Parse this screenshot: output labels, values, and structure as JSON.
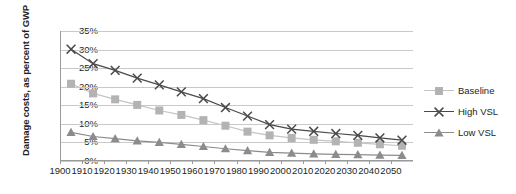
{
  "chart_data": {
    "type": "line",
    "title": "",
    "xlabel": "",
    "ylabel": "Damage costs, as percent of GWP",
    "xlim": [
      1900,
      2060
    ],
    "ylim": [
      0,
      35
    ],
    "ytick_labels": [
      "35%",
      "30%",
      "25%",
      "20%",
      "15%",
      "10%",
      "5%",
      "0%"
    ],
    "ytick_values": [
      35,
      30,
      25,
      20,
      15,
      10,
      5,
      0
    ],
    "xtick_labels": [
      "1900",
      "1910",
      "1920",
      "1930",
      "1940",
      "1950",
      "1960",
      "1970",
      "1980",
      "1990",
      "2000",
      "2010",
      "2020",
      "2030",
      "2040",
      "2050"
    ],
    "xtick_values": [
      1900,
      1910,
      1920,
      1930,
      1940,
      1950,
      1960,
      1970,
      1980,
      1990,
      2000,
      2010,
      2020,
      2030,
      2040,
      2050
    ],
    "grid": true,
    "legend_position": "right",
    "x": [
      1905,
      1915,
      1925,
      1935,
      1945,
      1955,
      1965,
      1975,
      1985,
      1995,
      2005,
      2015,
      2025,
      2035,
      2045,
      2055
    ],
    "series": [
      {
        "name": "Baseline",
        "marker": "square",
        "color": "#b3b3b3",
        "line_color": "#c4c4c4",
        "values": [
          20.8,
          18.2,
          16.6,
          15.1,
          13.6,
          12.4,
          11.0,
          9.5,
          7.9,
          6.9,
          6.2,
          5.7,
          5.3,
          4.9,
          4.5,
          4.1
        ]
      },
      {
        "name": "High VSL",
        "marker": "cross",
        "color": "#4a4a4a",
        "line_color": "#4a4a4a",
        "values": [
          30.1,
          26.2,
          24.4,
          22.3,
          20.5,
          18.6,
          16.8,
          14.4,
          12.1,
          9.8,
          8.6,
          8.0,
          7.4,
          6.9,
          6.2,
          5.6
        ]
      },
      {
        "name": "Low VSL",
        "marker": "triangle",
        "color": "#8c8c8c",
        "line_color": "#8c8c8c",
        "values": [
          7.7,
          6.6,
          6.0,
          5.4,
          5.0,
          4.5,
          3.9,
          3.3,
          2.8,
          2.3,
          2.1,
          1.9,
          1.8,
          1.7,
          1.6,
          1.5
        ]
      }
    ]
  },
  "legend": {
    "items": [
      {
        "label": "Baseline"
      },
      {
        "label": "High VSL"
      },
      {
        "label": "Low VSL"
      }
    ]
  }
}
